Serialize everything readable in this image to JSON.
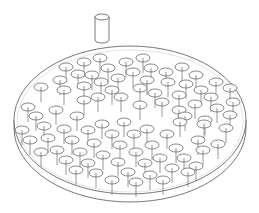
{
  "figure": {
    "stroke_color": "#555555",
    "background": "#ffffff",
    "cylinder": {
      "cx": 102,
      "top": 17,
      "bottom": 40,
      "rx": 7,
      "ry": 3
    },
    "plate": {
      "cx": 130,
      "cy": 120,
      "rx": 116,
      "ry": 74,
      "thickness": 8
    },
    "pins": [
      [
        100,
        58
      ],
      [
        84,
        62
      ],
      [
        143,
        58
      ],
      [
        126,
        62
      ],
      [
        66,
        67
      ],
      [
        108,
        68
      ],
      [
        151,
        68
      ],
      [
        182,
        67
      ],
      [
        78,
        74
      ],
      [
        92,
        75
      ],
      [
        133,
        72
      ],
      [
        166,
        72
      ],
      [
        118,
        78
      ],
      [
        196,
        75
      ],
      [
        147,
        80
      ],
      [
        60,
        80
      ],
      [
        41,
        87
      ],
      [
        101,
        82
      ],
      [
        84,
        86
      ],
      [
        64,
        90
      ],
      [
        168,
        82
      ],
      [
        140,
        88
      ],
      [
        112,
        90
      ],
      [
        186,
        84
      ],
      [
        216,
        82
      ],
      [
        201,
        90
      ],
      [
        230,
        88
      ],
      [
        155,
        93
      ],
      [
        179,
        95
      ],
      [
        98,
        97
      ],
      [
        121,
        97
      ],
      [
        84,
        100
      ],
      [
        211,
        97
      ],
      [
        233,
        102
      ],
      [
        162,
        102
      ],
      [
        140,
        105
      ],
      [
        195,
        104
      ],
      [
        28,
        107
      ],
      [
        56,
        110
      ],
      [
        179,
        110
      ],
      [
        217,
        108
      ],
      [
        36,
        116
      ],
      [
        77,
        116
      ],
      [
        102,
        124
      ],
      [
        124,
        122
      ],
      [
        44,
        126
      ],
      [
        22,
        130
      ],
      [
        64,
        129
      ],
      [
        147,
        129
      ],
      [
        204,
        124
      ],
      [
        230,
        115
      ],
      [
        226,
        128
      ],
      [
        185,
        116
      ],
      [
        205,
        120
      ],
      [
        180,
        122
      ],
      [
        88,
        130
      ],
      [
        112,
        134
      ],
      [
        167,
        134
      ],
      [
        48,
        138
      ],
      [
        30,
        140
      ],
      [
        72,
        140
      ],
      [
        134,
        134
      ],
      [
        198,
        140
      ],
      [
        218,
        144
      ],
      [
        94,
        143
      ],
      [
        120,
        145
      ],
      [
        152,
        145
      ],
      [
        176,
        148
      ],
      [
        57,
        150
      ],
      [
        41,
        152
      ],
      [
        80,
        152
      ],
      [
        103,
        155
      ],
      [
        136,
        152
      ],
      [
        160,
        158
      ],
      [
        184,
        158
      ],
      [
        203,
        150
      ],
      [
        66,
        160
      ],
      [
        88,
        163
      ],
      [
        118,
        162
      ],
      [
        145,
        163
      ],
      [
        172,
        168
      ],
      [
        196,
        166
      ],
      [
        76,
        170
      ],
      [
        96,
        173
      ],
      [
        128,
        172
      ],
      [
        150,
        175
      ],
      [
        112,
        180
      ],
      [
        136,
        182
      ],
      [
        163,
        180
      ],
      [
        188,
        172
      ]
    ]
  }
}
